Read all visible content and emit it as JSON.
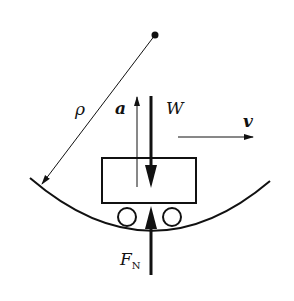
{
  "diagram": {
    "labels": {
      "radius": "ρ",
      "acceleration": "a",
      "weight": "W",
      "velocity": "v",
      "normal_force_main": "F",
      "normal_force_sub": "N"
    },
    "elements": {
      "center_point": {
        "x": 155,
        "y": 35
      },
      "track_curve": {
        "start": [
          30,
          178
        ],
        "bottom": [
          151,
          229
        ],
        "end": [
          270,
          181
        ]
      },
      "vehicle_body": {
        "x": 102,
        "y": 158,
        "width": 94,
        "height": 45
      },
      "wheels": [
        {
          "cx": 127,
          "cy": 217,
          "r": 9
        },
        {
          "cx": 172,
          "cy": 217,
          "r": 9
        }
      ],
      "radius_line": {
        "from": [
          155,
          35
        ],
        "to": [
          42,
          184
        ]
      },
      "acceleration_arrow": {
        "x": 137,
        "from_y": 187,
        "to_y": 97,
        "direction": "up"
      },
      "weight_arrow": {
        "x": 151,
        "from_y": 96,
        "to_y": 187,
        "direction": "down"
      },
      "normal_force_arrow": {
        "x": 151,
        "from_y": 275,
        "to_y": 206,
        "direction": "up"
      },
      "velocity_arrow": {
        "from": [
          178,
          137
        ],
        "to": [
          253,
          137
        ],
        "direction": "right"
      }
    },
    "colors": {
      "stroke": "#111111",
      "background": "#ffffff"
    }
  }
}
